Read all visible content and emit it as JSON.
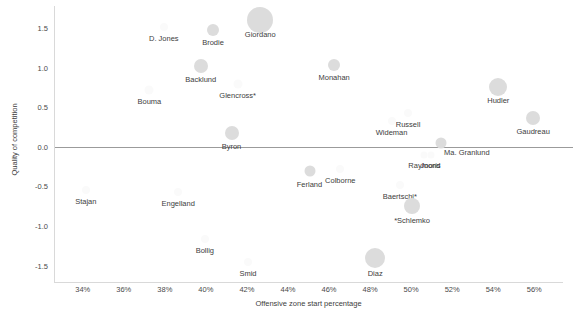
{
  "chart_data": {
    "type": "scatter",
    "title": "",
    "xlabel": "Offensive zone start percentage",
    "ylabel": "Quality of competition",
    "xlim": [
      32.6,
      57.4
    ],
    "ylim": [
      -1.72,
      1.78
    ],
    "xticks": [
      "34%",
      "36%",
      "38%",
      "40%",
      "42%",
      "44%",
      "46%",
      "48%",
      "50%",
      "52%",
      "54%",
      "56%"
    ],
    "xtick_values": [
      34,
      36,
      38,
      40,
      42,
      44,
      46,
      48,
      50,
      52,
      54,
      56
    ],
    "yticks": [
      "1.5",
      "1.0",
      "0.5",
      "0.0",
      "-0.5",
      "-1.0",
      "-1.5"
    ],
    "ytick_values": [
      1.5,
      1.0,
      0.5,
      0.0,
      -0.5,
      -1.0,
      -1.5
    ],
    "grid": false,
    "legend": "none",
    "reference_line_y": 0.0,
    "bubble_color": "#dcdcdc",
    "points": [
      {
        "label": "Giordano",
        "x": 42.6,
        "y": 1.6,
        "size": 26,
        "shade": "solid",
        "label_dx": 0,
        "label_dy": 10
      },
      {
        "label": "Brodie",
        "x": 40.3,
        "y": 1.48,
        "size": 12,
        "shade": "solid",
        "label_dx": 0,
        "label_dy": 8
      },
      {
        "label": "D. Jones",
        "x": 37.9,
        "y": 1.52,
        "size": 8,
        "shade": "vfaint",
        "label_dx": 0,
        "label_dy": 7
      },
      {
        "label": "Backlund",
        "x": 39.7,
        "y": 1.02,
        "size": 14,
        "shade": "solid",
        "label_dx": 0,
        "label_dy": 9
      },
      {
        "label": "Monahan",
        "x": 46.2,
        "y": 1.04,
        "size": 12,
        "shade": "solid",
        "label_dx": 0,
        "label_dy": 8
      },
      {
        "label": "Glencross*",
        "x": 41.5,
        "y": 0.8,
        "size": 9,
        "shade": "vfaint",
        "label_dx": 0,
        "label_dy": 7
      },
      {
        "label": "Bouma",
        "x": 37.2,
        "y": 0.72,
        "size": 9,
        "shade": "vfaint",
        "label_dx": 0,
        "label_dy": 7
      },
      {
        "label": "Hudler",
        "x": 54.2,
        "y": 0.76,
        "size": 18,
        "shade": "solid",
        "label_dx": 0,
        "label_dy": 9
      },
      {
        "label": "Russell",
        "x": 49.8,
        "y": 0.43,
        "size": 8,
        "shade": "vfaint",
        "label_dx": 0,
        "label_dy": 7
      },
      {
        "label": "Wideman",
        "x": 49.0,
        "y": 0.33,
        "size": 8,
        "shade": "vfaint",
        "label_dx": 0,
        "label_dy": 7
      },
      {
        "label": "Gaudreau",
        "x": 55.9,
        "y": 0.36,
        "size": 14,
        "shade": "solid",
        "label_dx": 0,
        "label_dy": 9
      },
      {
        "label": "Byron",
        "x": 41.2,
        "y": 0.17,
        "size": 14,
        "shade": "solid",
        "label_dx": 0,
        "label_dy": 9
      },
      {
        "label": "Ma. Granlund",
        "x": 51.4,
        "y": 0.05,
        "size": 11,
        "shade": "solid",
        "label_dx": 26,
        "label_dy": 5
      },
      {
        "label": "Raymond",
        "x": 50.6,
        "y": -0.1,
        "size": 7,
        "shade": "vfaint",
        "label_dx": 0,
        "label_dy": 6
      },
      {
        "label": "Jooris",
        "x": 50.9,
        "y": -0.1,
        "size": 7,
        "shade": "vfaint",
        "label_dx": 0,
        "label_dy": 6
      },
      {
        "label": "Colborne",
        "x": 46.5,
        "y": -0.28,
        "size": 8,
        "shade": "vfaint",
        "label_dx": 0,
        "label_dy": 7
      },
      {
        "label": "Ferland",
        "x": 45.0,
        "y": -0.3,
        "size": 11,
        "shade": "solid",
        "label_dx": 0,
        "label_dy": 9
      },
      {
        "label": "Baertschi*",
        "x": 49.4,
        "y": -0.48,
        "size": 8,
        "shade": "vfaint",
        "label_dx": 0,
        "label_dy": 7
      },
      {
        "label": "Stajan",
        "x": 34.1,
        "y": -0.55,
        "size": 8,
        "shade": "vfaint",
        "label_dx": 0,
        "label_dy": 7
      },
      {
        "label": "Engelland",
        "x": 38.6,
        "y": -0.57,
        "size": 8,
        "shade": "vfaint",
        "label_dx": 0,
        "label_dy": 7
      },
      {
        "label": "*Schlemko",
        "x": 50.0,
        "y": -0.75,
        "size": 16,
        "shade": "solid",
        "label_dx": 0,
        "label_dy": 10
      },
      {
        "label": "Bollig",
        "x": 39.9,
        "y": -1.17,
        "size": 8,
        "shade": "vfaint",
        "label_dx": 0,
        "label_dy": 7
      },
      {
        "label": "Smid",
        "x": 42.0,
        "y": -1.45,
        "size": 8,
        "shade": "vfaint",
        "label_dx": 0,
        "label_dy": 7
      },
      {
        "label": "Diaz",
        "x": 48.2,
        "y": -1.4,
        "size": 20,
        "shade": "solid",
        "label_dx": 0,
        "label_dy": 11
      }
    ]
  }
}
